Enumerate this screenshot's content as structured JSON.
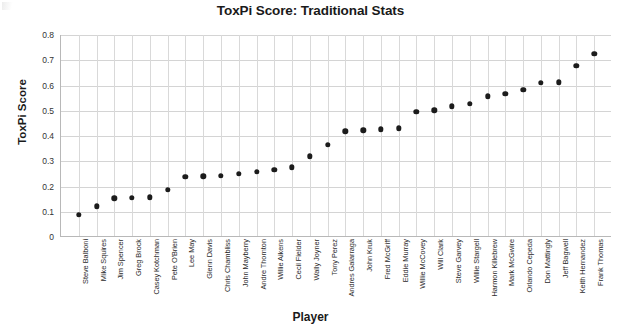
{
  "chart_data": {
    "type": "scatter",
    "title": "ToxPi Score: Traditional Stats",
    "xlabel": "Player",
    "ylabel": "ToxPi Score",
    "ylim": [
      0,
      0.8
    ],
    "ytick_labels": [
      "0",
      "0.1",
      "0.2",
      "0.3",
      "0.4",
      "0.5",
      "0.6",
      "0.7",
      "0.8"
    ],
    "ytick_values": [
      0,
      0.1,
      0.2,
      0.3,
      0.4,
      0.5,
      0.6,
      0.7,
      0.8
    ],
    "grid": true,
    "legend": "none",
    "marker": "filled-circle",
    "marker_color": "#1c1c1c",
    "categories": [
      "Steve Balboni",
      "Mike Squires",
      "Jim Spencer",
      "Greg Brock",
      "Casey Kotchman",
      "Pete O'Brien",
      "Lee May",
      "Glenn Davis",
      "Chris Chambliss",
      "John Mayberry",
      "Andre Thornton",
      "Willie Aikens",
      "Cecil Fielder",
      "Wally Joyner",
      "Tony Perez",
      "Andres Galarraga",
      "John Kruk",
      "Fred McGriff",
      "Eddie Murray",
      "Willie McCovey",
      "Will Clark",
      "Steve Garvey",
      "Willie Stargell",
      "Harmon Killebrew",
      "Mark McGwire",
      "Orlando Cepeda",
      "Don Mattingly",
      "Jeff Bagwell",
      "Keith Hernandez",
      "Frank Thomas"
    ],
    "values": [
      0.089,
      0.122,
      0.154,
      0.155,
      0.157,
      0.186,
      0.239,
      0.24,
      0.242,
      0.25,
      0.259,
      0.266,
      0.276,
      0.32,
      0.365,
      0.418,
      0.422,
      0.426,
      0.43,
      0.497,
      0.502,
      0.517,
      0.527,
      0.557,
      0.567,
      0.582,
      0.61,
      0.613,
      0.678,
      0.725
    ]
  }
}
